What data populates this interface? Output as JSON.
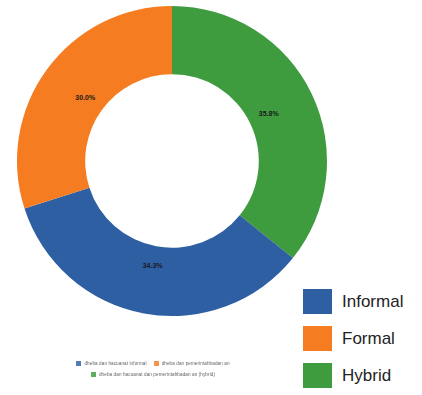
{
  "chart_data": {
    "type": "pie",
    "variant": "donut",
    "title": "",
    "xlabel": "",
    "ylabel": "",
    "categories": [
      "Hybrid",
      "Informal",
      "Formal"
    ],
    "values": [
      35.8,
      34.3,
      30.0
    ],
    "value_labels": [
      "35.8%",
      "34.3%",
      "30.0%"
    ],
    "colors": [
      "#3E9B3E",
      "#2E5FA3",
      "#F57C20"
    ],
    "start_angle_deg": 0,
    "direction": "clockwise",
    "inner_radius_ratio": 0.56,
    "legend_position": "right",
    "grid": false,
    "slices": [
      {
        "name": "Hybrid",
        "value": 35.8,
        "label": "35.8%",
        "color": "#3E9B3E"
      },
      {
        "name": "Informal",
        "value": 34.3,
        "label": "34.3%",
        "color": "#2E5FA3"
      },
      {
        "name": "Formal",
        "value": 30.0,
        "label": "30.0%",
        "color": "#F57C20"
      }
    ]
  },
  "legend_main": {
    "items": [
      {
        "label": "Informal",
        "color": "#2E5FA3"
      },
      {
        "label": "Formal",
        "color": "#F57C20"
      },
      {
        "label": "Hybrid",
        "color": "#3E9B3E"
      }
    ]
  },
  "legend_bottom": {
    "items": [
      {
        "label": "dheba dan hacuanat informal",
        "color": "#2E5FA3"
      },
      {
        "label": "dheba dan pemerintahbadan an",
        "color": "#F57C20"
      },
      {
        "label": "dheba dan hacuanat dan pemerintahbadan an (hybrid)",
        "color": "#3E9B3E"
      }
    ]
  }
}
